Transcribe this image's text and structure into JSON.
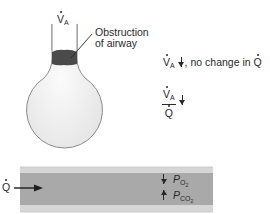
{
  "diagram": {
    "alveolus": {
      "ventilation_label": {
        "symbol": "V",
        "subscript": "A",
        "dot": true
      },
      "obstruction_label": {
        "line1": "Obstruction",
        "line2": "of airway"
      }
    },
    "annotations": {
      "line1": {
        "symbol": "V",
        "subscript": "A",
        "arrow": "down",
        "text": ", no change in ",
        "trailing_symbol": "Q",
        "trailing_dot": true
      },
      "ratio": {
        "numerator_symbol": "V",
        "numerator_subscript": "A",
        "denominator_symbol": "Q",
        "arrow": "down"
      }
    },
    "capillary": {
      "flow_label": {
        "symbol": "Q",
        "dot": true
      },
      "gas_labels": [
        {
          "symbol": "P",
          "subscript": "O",
          "sub_sub": "2",
          "arrow": "down"
        },
        {
          "symbol": "P",
          "subscript": "CO",
          "sub_sub": "2",
          "arrow": "up"
        }
      ]
    },
    "colors": {
      "alveolus_fill": "#f1f1f1",
      "alveolus_stroke": "#8a8a8a",
      "obstruction": "#4a4a4a",
      "capillary_outer": "#d6d6d6",
      "capillary_inner": "#a9a9a9",
      "text": "#2a2a2a"
    }
  }
}
